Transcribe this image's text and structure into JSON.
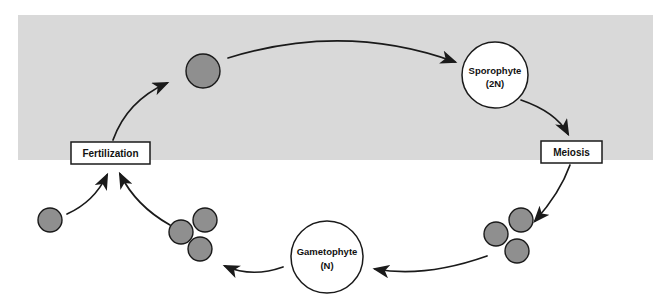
{
  "diagram": {
    "band": {
      "name": "diploid-phase-band",
      "color": "#d9d9d9",
      "x": 18,
      "y": 15,
      "width": 635,
      "height": 145
    },
    "colors": {
      "cell_fill": "#8f8f8f",
      "cell_stroke": "#1a1a1a",
      "node_fill": "#ffffff",
      "node_stroke": "#1a1a1a",
      "arrow": "#1a1a1a",
      "band": "#d9d9d9",
      "text": "#111111",
      "page_background": "#ffffff"
    },
    "nodes": [
      {
        "id": "sporophyte",
        "name": "sporophyte-node",
        "label_line1": "Sporophyte",
        "label_line2": "(2N)",
        "shape": "circle",
        "cx": 495,
        "cy": 75,
        "r": 33
      },
      {
        "id": "gametophyte",
        "name": "gametophyte-node",
        "label_line1": "Gametophyte",
        "label_line2": "(N)",
        "shape": "circle",
        "cx": 327,
        "cy": 257,
        "r": 36
      }
    ],
    "boxes": [
      {
        "id": "fertilization",
        "name": "fertilization-box",
        "label": "Fertilization",
        "x": 71,
        "y": 142,
        "width": 79,
        "height": 22
      },
      {
        "id": "meiosis",
        "name": "meiosis-box",
        "label": "Meiosis",
        "x": 541,
        "y": 141,
        "width": 61,
        "height": 22
      }
    ],
    "cells": [
      {
        "id": "zygote",
        "name": "zygote-cell",
        "cx": 203,
        "cy": 71,
        "r": 17,
        "group": "zygote"
      },
      {
        "id": "gamete",
        "name": "gamete-cell",
        "cx": 50,
        "cy": 220,
        "r": 12,
        "group": "gamete"
      },
      {
        "id": "spore-left-a",
        "name": "spore-cell",
        "cx": 181,
        "cy": 232,
        "r": 12,
        "group": "spores-left"
      },
      {
        "id": "spore-left-b",
        "name": "spore-cell",
        "cx": 205,
        "cy": 220,
        "r": 12,
        "group": "spores-left"
      },
      {
        "id": "spore-left-c",
        "name": "spore-cell",
        "cx": 200,
        "cy": 249,
        "r": 12,
        "group": "spores-left"
      },
      {
        "id": "spore-right-a",
        "name": "spore-cell",
        "cx": 496,
        "cy": 234,
        "r": 12,
        "group": "spores-right"
      },
      {
        "id": "spore-right-b",
        "name": "spore-cell",
        "cx": 521,
        "cy": 220,
        "r": 12,
        "group": "spores-right"
      },
      {
        "id": "spore-right-c",
        "name": "spore-cell",
        "cx": 517,
        "cy": 251,
        "r": 12,
        "group": "spores-right"
      }
    ],
    "arrows": [
      {
        "id": "zygote-to-sporophyte",
        "name": "arrow-zygote-to-sporophyte",
        "path": "M 228 58 Q 345 22 455 62"
      },
      {
        "id": "sporophyte-to-meiosis",
        "name": "arrow-sporophyte-to-meiosis",
        "path": "M 521 100 Q 556 112 568 134"
      },
      {
        "id": "meiosis-to-spores",
        "name": "arrow-meiosis-to-spores",
        "path": "M 570 165 Q 560 193 533 222"
      },
      {
        "id": "spores-to-gametophyte",
        "name": "arrow-spores-to-gametophyte",
        "path": "M 487 256 Q 425 278 373 269"
      },
      {
        "id": "gametophyte-to-gametes",
        "name": "arrow-gametophyte-to-gametes",
        "path": "M 283 267 Q 252 278 223 266"
      },
      {
        "id": "gametes-to-fertilization-left",
        "name": "arrow-gamete-to-fertilization",
        "path": "M 67 214 Q 94 200 108 176"
      },
      {
        "id": "gametes-to-fertilization-right",
        "name": "arrow-spores-to-fertilization",
        "path": "M 170 225 Q 135 205 119 174"
      },
      {
        "id": "fertilization-to-zygote",
        "name": "arrow-fertilization-to-zygote",
        "path": "M 114 140 Q 128 102 168 84"
      }
    ]
  }
}
